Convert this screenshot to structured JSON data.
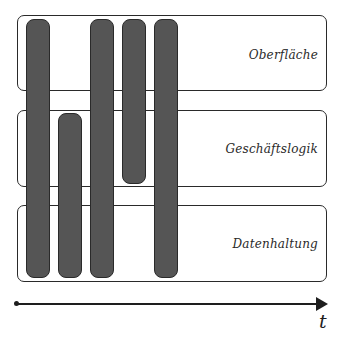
{
  "diagram": {
    "type": "layer-activity-timeline",
    "layers": [
      {
        "label": "Oberfläche",
        "top": 15,
        "height": 76,
        "label_top": 32
      },
      {
        "label": "Geschäftslogik",
        "top": 110,
        "height": 77,
        "label_top": 31
      },
      {
        "label": "Datenhaltung",
        "top": 205,
        "height": 77,
        "label_top": 31
      }
    ],
    "bars": [
      {
        "id": 1,
        "left": 26,
        "top": 19,
        "height": 259,
        "spans": [
          "Oberfläche",
          "Geschäftslogik",
          "Datenhaltung"
        ]
      },
      {
        "id": 2,
        "left": 58,
        "top": 113,
        "height": 165,
        "spans": [
          "Geschäftslogik",
          "Datenhaltung"
        ]
      },
      {
        "id": 3,
        "left": 90,
        "top": 19,
        "height": 259,
        "spans": [
          "Oberfläche",
          "Geschäftslogik",
          "Datenhaltung"
        ]
      },
      {
        "id": 4,
        "left": 122,
        "top": 19,
        "height": 165,
        "spans": [
          "Oberfläche",
          "Geschäftslogik"
        ]
      },
      {
        "id": 5,
        "left": 154,
        "top": 19,
        "height": 259,
        "spans": [
          "Oberfläche",
          "Geschäftslogik",
          "Datenhaltung"
        ]
      }
    ],
    "axis": {
      "label": "t"
    },
    "colors": {
      "bar_fill": "#555555",
      "stroke": "#2a2a2a",
      "background": "#ffffff"
    }
  }
}
